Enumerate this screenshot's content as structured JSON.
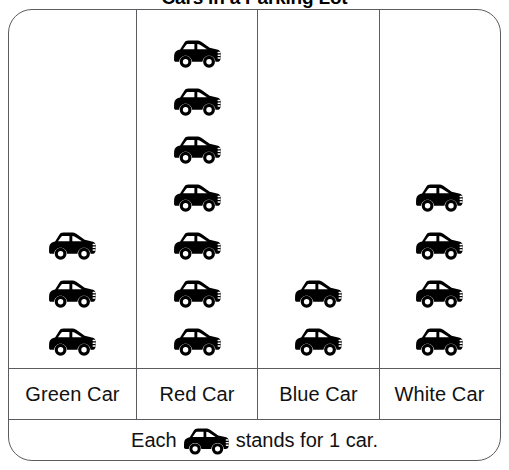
{
  "title": "Cars in a Parking Lot",
  "icon": {
    "name": "car-icon",
    "unit_value": 1
  },
  "legend": {
    "prefix": "Each",
    "suffix": "stands for 1 car."
  },
  "columns": [
    {
      "label": "Green Car",
      "count": 3
    },
    {
      "label": "Red Car",
      "count": 7
    },
    {
      "label": "Blue Car",
      "count": 2
    },
    {
      "label": "White Car",
      "count": 4
    }
  ],
  "colors": {
    "icon": "#000000",
    "border": "#5b5b60",
    "background": "#ffffff",
    "text": "#111111"
  },
  "chart_data": {
    "type": "bar",
    "subtype": "pictograph",
    "title": "Cars in a Parking Lot",
    "categories": [
      "Green Car",
      "Red Car",
      "Blue Car",
      "White Car"
    ],
    "values": [
      3,
      7,
      2,
      4
    ],
    "xlabel": "",
    "ylabel": "",
    "ylim": [
      0,
      7
    ],
    "grid": false,
    "legend_position": "bottom",
    "icon_unit": 1,
    "icon_label": "car",
    "annotations": [
      "Each car icon stands for 1 car."
    ]
  }
}
